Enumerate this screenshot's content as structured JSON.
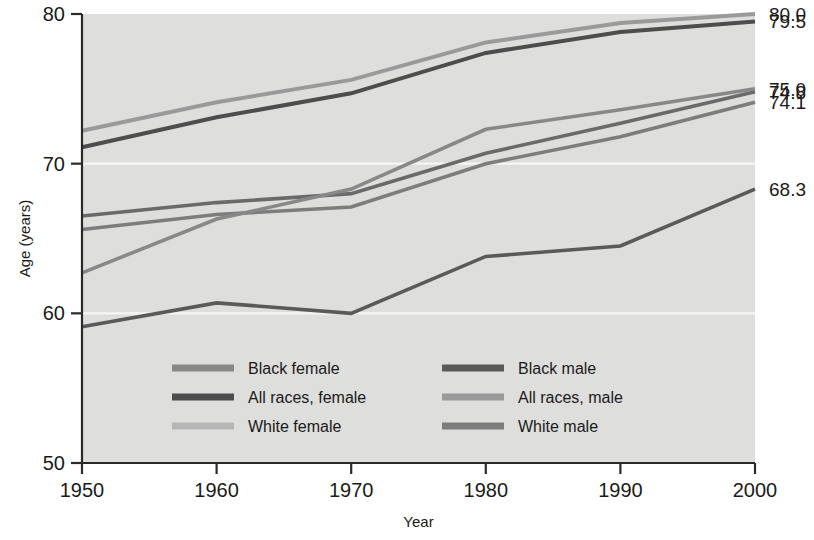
{
  "chart_data": {
    "type": "line",
    "title": "",
    "xlabel": "Year",
    "ylabel": "Age (years)",
    "x": [
      1950,
      1960,
      1970,
      1980,
      1990,
      2000
    ],
    "xticklabels": [
      "1950",
      "1960",
      "1970",
      "1980",
      "1990",
      "2000"
    ],
    "xlim": [
      1950,
      2000
    ],
    "ylim": [
      50,
      80
    ],
    "yticklabels": [
      "50",
      "60",
      "70",
      "80"
    ],
    "yticks": [
      50,
      60,
      70,
      80
    ],
    "grid": "horizontal-white-gridlines",
    "legend_position": "inside-lower-left",
    "plot_background": "#dededc",
    "series": [
      {
        "name": "All races, female",
        "color": "#4d4d4d",
        "width": 4.0,
        "values": [
          71.1,
          73.1,
          74.7,
          77.4,
          78.8,
          79.5
        ],
        "end_label": "79.5"
      },
      {
        "name": "White female",
        "color": "#9a9a9a",
        "width": 4.0,
        "values": [
          72.2,
          74.1,
          75.6,
          78.1,
          79.4,
          80.0
        ],
        "end_label": "80.0"
      },
      {
        "name": "All races, male",
        "color": "#7d7d7d",
        "width": 3.6,
        "values": [
          65.6,
          66.6,
          67.1,
          70.0,
          71.8,
          74.1
        ],
        "end_label": "74.1"
      },
      {
        "name": "White male",
        "color": "#6a6a6a",
        "width": 3.6,
        "values": [
          66.5,
          67.4,
          68.0,
          70.7,
          72.7,
          74.8
        ],
        "end_label": "74.8"
      },
      {
        "name": "Black female",
        "color": "#888888",
        "width": 3.6,
        "values": [
          62.7,
          66.3,
          68.3,
          72.3,
          73.6,
          75.0
        ],
        "end_label": "75.0"
      },
      {
        "name": "Black male",
        "color": "#5a5a5a",
        "width": 3.6,
        "values": [
          59.1,
          60.7,
          60.0,
          63.8,
          64.5,
          68.3
        ],
        "end_label": "68.3"
      }
    ],
    "end_labels": [
      {
        "text": "80.0",
        "value": 80.0
      },
      {
        "text": "79.5",
        "value": 79.5
      },
      {
        "text": "75.0",
        "value": 75.0
      },
      {
        "text": "74.8",
        "value": 74.8
      },
      {
        "text": "74.1",
        "value": 74.1
      },
      {
        "text": "68.3",
        "value": 68.3
      }
    ],
    "legend": [
      {
        "label": "Black female",
        "color": "#888888",
        "col": 0,
        "row": 0
      },
      {
        "label": "Black male",
        "color": "#5a5a5a",
        "col": 1,
        "row": 0
      },
      {
        "label": "All races, female",
        "color": "#4d4d4d",
        "col": 0,
        "row": 1
      },
      {
        "label": "All races, male",
        "color": "#9a9a9a",
        "col": 1,
        "row": 1
      },
      {
        "label": "White female",
        "color": "#b5b5b5",
        "col": 0,
        "row": 2
      },
      {
        "label": "White male",
        "color": "#7d7d7d",
        "col": 1,
        "row": 2
      }
    ]
  }
}
